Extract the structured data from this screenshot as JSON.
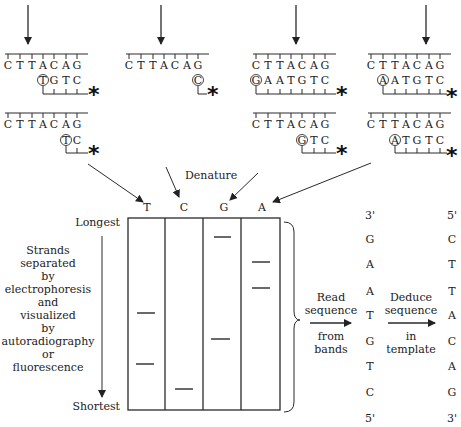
{
  "template": {
    "bases": [
      "C",
      "T",
      "T",
      "A",
      "C",
      "A",
      "G"
    ]
  },
  "reactions": [
    {
      "id": "T-reaction",
      "products": [
        {
          "synth": [
            "T",
            "G",
            "T",
            "C"
          ],
          "circled": "T"
        },
        {
          "synth": [
            "T",
            "C"
          ],
          "circled": "T"
        }
      ]
    },
    {
      "id": "C-reaction",
      "products": [
        {
          "synth": [
            "C"
          ],
          "circled": "C"
        }
      ]
    },
    {
      "id": "G-reaction",
      "products": [
        {
          "synth": [
            "G",
            "A",
            "A",
            "T",
            "G",
            "T",
            "C"
          ],
          "circled": "G"
        },
        {
          "synth": [
            "G",
            "T",
            "C"
          ],
          "circled": "G"
        }
      ]
    },
    {
      "id": "A-reaction",
      "products": [
        {
          "synth": [
            "A",
            "A",
            "T",
            "G",
            "T",
            "C"
          ],
          "circled": "A"
        },
        {
          "synth": [
            "A",
            "T",
            "G",
            "T",
            "C"
          ],
          "circled": "A"
        }
      ]
    }
  ],
  "label_marker": "*",
  "denature_label": "Denature",
  "gel": {
    "lanes": [
      "T",
      "C",
      "G",
      "A"
    ],
    "top_label": "Longest",
    "bottom_label": "Shortest",
    "side_text": [
      "Strands",
      "separated",
      "by",
      "electrophoresis",
      "and",
      "visualized",
      "by",
      "autoradiography",
      "or",
      "fluorescence"
    ]
  },
  "step1": {
    "line1": "Read",
    "line2": "sequence",
    "line3": "from",
    "line4": "bands"
  },
  "step2": {
    "line1": "Deduce",
    "line2": "sequence",
    "line3": "in",
    "line4": "template"
  },
  "read_sequence": {
    "top": "3'",
    "bases": [
      "G",
      "A",
      "A",
      "T",
      "G",
      "T",
      "C"
    ],
    "bottom": "5'"
  },
  "template_sequence": {
    "top": "5'",
    "bases": [
      "C",
      "T",
      "T",
      "A",
      "C",
      "A",
      "G"
    ],
    "bottom": "3'"
  }
}
